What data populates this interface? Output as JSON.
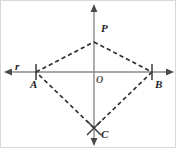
{
  "figure": {
    "background_color": "#ffffff",
    "border_color": "#d8d8d8",
    "width": 176,
    "height": 148
  },
  "axes": {
    "horizontal": {
      "name": "line-r",
      "label": "r",
      "color": "#8a8a8a",
      "y": 71,
      "x_start": 4,
      "x_end": 172,
      "arrow_left": true,
      "arrow_right": true
    },
    "vertical": {
      "name": "vertical-axis",
      "label": "",
      "color": "#8a8a8a",
      "x": 93,
      "y_start": 4,
      "y_end": 144,
      "arrow_up": true,
      "arrow_down": true
    }
  },
  "points": [
    {
      "id": "A",
      "label": "A",
      "x": 35,
      "y": 71,
      "tick": "vertical",
      "label_dx": -6,
      "label_dy": 13
    },
    {
      "id": "B",
      "label": "B",
      "x": 151,
      "y": 71,
      "tick": "vertical",
      "label_dx": 4,
      "label_dy": 13
    },
    {
      "id": "P",
      "label": "P",
      "x": 93,
      "y": 41,
      "tick": "none",
      "label_dx": 8,
      "label_dy": -13
    },
    {
      "id": "C",
      "label": "C",
      "x": 93,
      "y": 127,
      "tick": "cross",
      "label_dx": 8,
      "label_dy": 7
    },
    {
      "id": "O",
      "label": "O",
      "x": 93,
      "y": 71,
      "tick": "none",
      "label_dx": 3,
      "label_dy": 9
    }
  ],
  "segments": [
    {
      "id": "AP",
      "from": "A",
      "to": "P",
      "style": "dashed",
      "color": "#2f2f2f"
    },
    {
      "id": "PB",
      "from": "P",
      "to": "B",
      "style": "dashed",
      "color": "#2f2f2f"
    },
    {
      "id": "BC",
      "from": "B",
      "to": "C",
      "style": "dashed",
      "color": "#2f2f2f"
    },
    {
      "id": "CA",
      "from": "C",
      "to": "A",
      "style": "dashed",
      "color": "#2f2f2f"
    }
  ],
  "labels": {
    "r": "r",
    "A": "A",
    "B": "B",
    "P": "P",
    "C": "C",
    "O": "O"
  },
  "colors": {
    "axis": "#8a8a8a",
    "dash": "#2f2f2f",
    "tick": "#3b3b3b",
    "text": "#1d1d1d",
    "origin_text": "#555555"
  }
}
